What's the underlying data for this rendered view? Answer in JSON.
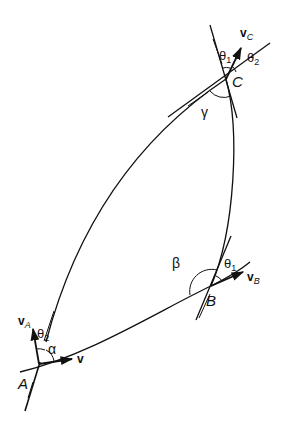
{
  "diagram": {
    "type": "trajectory-velocity-geometry",
    "colors": {
      "ink": "#111111",
      "background": "#ffffff"
    },
    "points": {
      "A": {
        "label": "A",
        "x": 39,
        "y": 364
      },
      "B": {
        "label": "B",
        "x": 211,
        "y": 286
      },
      "C": {
        "label": "C",
        "x": 226,
        "y": 79
      }
    },
    "vectors": {
      "v": {
        "label": "v",
        "at": "A"
      },
      "vA": {
        "label": "v",
        "subscript": "A",
        "at": "A"
      },
      "vB": {
        "label": "v",
        "subscript": "B",
        "at": "B"
      },
      "vC": {
        "label": "v",
        "subscript": "C",
        "at": "C"
      }
    },
    "angles": {
      "alpha": {
        "label": "α",
        "at": "A"
      },
      "beta": {
        "label": "β",
        "at": "B"
      },
      "gamma": {
        "label": "γ",
        "at": "C"
      },
      "theta1_B": {
        "label": "θ",
        "subscript": "1",
        "at": "B"
      },
      "theta1_C": {
        "label": "θ",
        "subscript": "1",
        "at": "C"
      },
      "theta2_C": {
        "label": "θ",
        "subscript": "2",
        "at": "C"
      },
      "theta2_A": {
        "label": "θ",
        "subscript": "2",
        "at": "A"
      }
    },
    "curves": [
      {
        "name": "arc-A-to-C",
        "from": "A",
        "to": "C"
      },
      {
        "name": "arc-C-to-B",
        "from": "C",
        "to": "B"
      },
      {
        "name": "arc-A-to-B",
        "from": "A",
        "to": "B"
      }
    ]
  }
}
